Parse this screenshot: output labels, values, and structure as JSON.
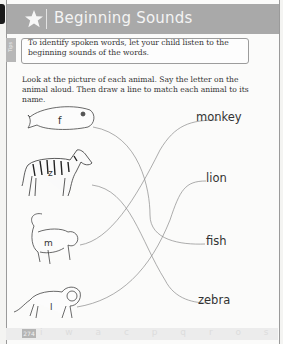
{
  "header": {
    "title": "Beginning Sounds",
    "icon": "star-icon"
  },
  "side_tab": {
    "label": "Tips"
  },
  "tip": {
    "text": "To identify spoken words, let your child listen to the beginning sounds of the words."
  },
  "instructions": {
    "text": "Look at the picture of each animal. Say the letter on the animal aloud. Then draw a line to match each animal to its name."
  },
  "animals": [
    {
      "name": "fish",
      "letter": "f",
      "icon": "fish-icon"
    },
    {
      "name": "zebra",
      "letter": "z",
      "icon": "zebra-icon"
    },
    {
      "name": "monkey",
      "letter": "m",
      "icon": "monkey-icon"
    },
    {
      "name": "lion",
      "letter": "l",
      "icon": "lion-icon"
    }
  ],
  "names": [
    {
      "label": "monkey"
    },
    {
      "label": "lion"
    },
    {
      "label": "fish"
    },
    {
      "label": "zebra"
    }
  ],
  "matches": [
    {
      "from": "fish",
      "to": "fish"
    },
    {
      "from": "zebra",
      "to": "zebra"
    },
    {
      "from": "monkey",
      "to": "monkey"
    },
    {
      "from": "lion",
      "to": "lion"
    }
  ],
  "footer": {
    "page_number": "274",
    "letters": "i w a c p q r o s t u v w z"
  },
  "colors": {
    "header_band": "#a9a9a9",
    "ink": "#333333",
    "line": "#8a8a8a"
  }
}
